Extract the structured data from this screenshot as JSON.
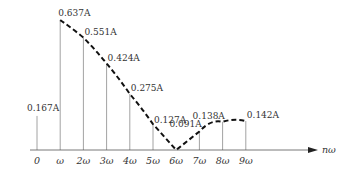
{
  "chart_data": {
    "type": "line",
    "title": "",
    "xlabel": "nω",
    "ylabel": "",
    "categories": [
      "0",
      "ω",
      "2ω",
      "3ω",
      "4ω",
      "5ω",
      "6ω",
      "7ω",
      "8ω",
      "9ω"
    ],
    "series": [
      {
        "name": "Harmonic amplitude (stems)",
        "values": [
          0.167,
          0.637,
          0.551,
          0.424,
          0.275,
          0.127,
          0.0,
          0.091,
          0.138,
          0.142
        ]
      }
    ],
    "value_labels": [
      "0.167A",
      "0.637A",
      "0.551A",
      "0.424A",
      "0.275A",
      "0.127A",
      "",
      "0.091A",
      "0.138A",
      "0.142A"
    ],
    "envelope": "dashed curve through stem tops from ω to 9ω, reaching zero at 6ω",
    "grid": false,
    "ylim": [
      0,
      0.7
    ],
    "legend": "none"
  },
  "axis": {
    "x_label": "nω",
    "ticks": [
      "0",
      "ω",
      "2ω",
      "3ω",
      "4ω",
      "5ω",
      "6ω",
      "7ω",
      "8ω",
      "9ω"
    ]
  },
  "colors": {
    "stem": "#8a8a8a",
    "envelope": "#111111",
    "axis": "#555555",
    "text": "#333333"
  }
}
